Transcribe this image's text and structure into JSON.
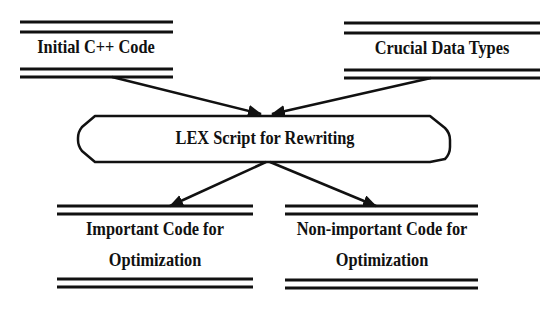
{
  "diagram": {
    "type": "data-flow",
    "nodes": [
      {
        "id": "initial_code",
        "shape": "data-store",
        "label": "Initial C++ Code"
      },
      {
        "id": "data_types",
        "shape": "data-store",
        "label": "Crucial Data Types"
      },
      {
        "id": "lex_script",
        "shape": "rounded-process",
        "label": "LEX Script for Rewriting"
      },
      {
        "id": "important",
        "shape": "data-store",
        "label_line1": "Important Code for",
        "label_line2": "Optimization"
      },
      {
        "id": "non_important",
        "shape": "data-store",
        "label_line1": "Non-important Code for",
        "label_line2": "Optimization"
      }
    ],
    "edges": [
      {
        "from": "initial_code",
        "to": "lex_script"
      },
      {
        "from": "data_types",
        "to": "lex_script"
      },
      {
        "from": "lex_script",
        "to": "important"
      },
      {
        "from": "lex_script",
        "to": "non_important"
      }
    ],
    "colors": {
      "line": "#111111",
      "background": "#ffffff"
    }
  }
}
